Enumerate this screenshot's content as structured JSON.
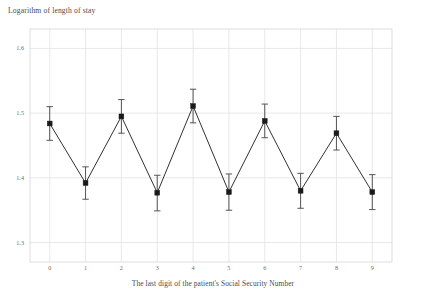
{
  "chart_data": {
    "type": "line",
    "title": "Logarithm of length of stay",
    "xlabel": "The last digit of the patient's Social Security Number",
    "ylabel": "",
    "categories": [
      "0",
      "1",
      "2",
      "3",
      "4",
      "5",
      "6",
      "7",
      "8",
      "9"
    ],
    "x": [
      0,
      1,
      2,
      3,
      4,
      5,
      6,
      7,
      8,
      9
    ],
    "values": [
      1.484,
      1.392,
      1.495,
      1.377,
      1.511,
      1.378,
      1.488,
      1.38,
      1.469,
      1.378
    ],
    "error_low": [
      1.458,
      1.367,
      1.469,
      1.349,
      1.485,
      1.35,
      1.462,
      1.353,
      1.443,
      1.351
    ],
    "error_high": [
      1.51,
      1.417,
      1.521,
      1.404,
      1.537,
      1.406,
      1.514,
      1.407,
      1.495,
      1.405
    ],
    "ylim": [
      1.27,
      1.63
    ],
    "xlim": [
      -0.55,
      9.55
    ],
    "yticks": [
      "1.6",
      "1.5",
      "1.4",
      "1.3"
    ],
    "ytick_values": [
      1.6,
      1.5,
      1.4,
      1.3
    ],
    "xticks": [
      "0",
      "1",
      "2",
      "3",
      "4",
      "5",
      "6",
      "7",
      "8",
      "9"
    ],
    "grid": true,
    "legend": null,
    "marker": "square",
    "series_color": "#1a1a1a",
    "grid_color": "#e2e2e2",
    "background_color": "#ffffff",
    "errorbar_color": "#555555"
  },
  "axes": {
    "title_text": "Logarithm of length of stay",
    "xaxis_title": "The last digit of the patient's Social Security Number"
  }
}
